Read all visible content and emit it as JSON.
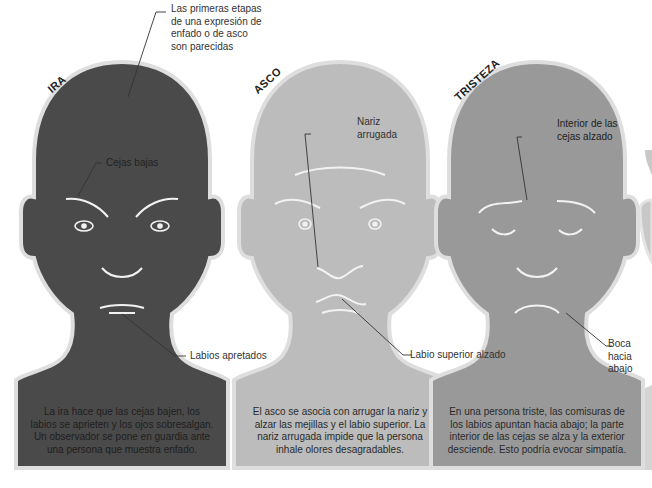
{
  "colors": {
    "ira_face": "#4a4a4a",
    "asco_face": "#bcbcbc",
    "tristeza_face": "#999999",
    "outline": "#dedede",
    "feature_lines": "#f2f2f2",
    "leader_lines": "#333333"
  },
  "top_annotation": "Las primeras etapas de una expresión de enfado o de asco son parecidas",
  "top_annotation_lines": [
    "Las primeras etapas",
    "de una expresión de",
    "enfado o de asco",
    "son parecidas"
  ],
  "faces": [
    {
      "id": "ira",
      "title": "IRA",
      "annotations": [
        {
          "label": "Cejas bajas"
        },
        {
          "label": "Labios apretados"
        }
      ],
      "description_lines": [
        "La ira hace que las cejas bajen, los",
        "labios se aprieten y los ojos sobresalgan.",
        "Un observador se pone en guardia ante",
        "una persona que muestra enfado."
      ]
    },
    {
      "id": "asco",
      "title": "ASCO",
      "annotations": [
        {
          "label_lines": [
            "Nariz",
            "arrugada"
          ]
        },
        {
          "label": "Labio superior alzado"
        }
      ],
      "description_lines": [
        "El asco se asocia con arrugar la nariz y",
        "alzar las mejillas y el labio superior. La",
        "nariz arrugada impide que la persona",
        "inhale olores desagradables."
      ]
    },
    {
      "id": "tristeza",
      "title": "TRISTEZA",
      "annotations": [
        {
          "label_lines": [
            "Interior de las",
            "cejas alzado"
          ]
        },
        {
          "label_lines": [
            "Boca",
            "hacia",
            "abajo"
          ]
        }
      ],
      "description_lines": [
        "En una persona triste, las comisuras de",
        "los labios apuntan hacia abajo; la parte",
        "interior de las cejas se alza y la exterior",
        "desciende. Esto podría evocar simpatía."
      ]
    }
  ]
}
